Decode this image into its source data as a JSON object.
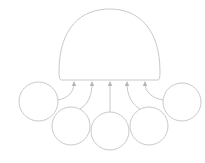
{
  "diagram": {
    "type": "convergent-inputs",
    "stroke_color": "#c9c9c9",
    "fill_color": "#ffffff",
    "background": "#ffffff",
    "hub": {
      "shape": "semicircle-dome",
      "left": 59,
      "right": 160,
      "top": 9,
      "base_y": 80,
      "label": ""
    },
    "nodes": [
      {
        "id": "node-1",
        "cx": 38.5,
        "cy": 101.5,
        "r": 19.5,
        "label": ""
      },
      {
        "id": "node-2",
        "cx": 71,
        "cy": 126,
        "r": 19,
        "label": ""
      },
      {
        "id": "node-3",
        "cx": 110,
        "cy": 131,
        "r": 19,
        "label": ""
      },
      {
        "id": "node-4",
        "cx": 149,
        "cy": 126,
        "r": 19,
        "label": ""
      },
      {
        "id": "node-5",
        "cx": 182,
        "cy": 102,
        "r": 19,
        "label": ""
      }
    ],
    "arrows": [
      {
        "from": "node-1",
        "to": "hub",
        "path": "M58,100 C68,98 74,92 74,83",
        "tip": [
          74,
          81
        ]
      },
      {
        "from": "node-2",
        "to": "hub",
        "path": "M80,109 C88,104 92,96 92,83",
        "tip": [
          92,
          81
        ]
      },
      {
        "from": "node-3",
        "to": "hub",
        "path": "M110,112 L110,83",
        "tip": [
          110,
          81
        ]
      },
      {
        "from": "node-4",
        "to": "hub",
        "path": "M140,109 C132,104 127,96 127,83",
        "tip": [
          127,
          81
        ]
      },
      {
        "from": "node-5",
        "to": "hub",
        "path": "M163,100 C152,98 145,92 145,83",
        "tip": [
          145,
          81
        ]
      }
    ]
  }
}
